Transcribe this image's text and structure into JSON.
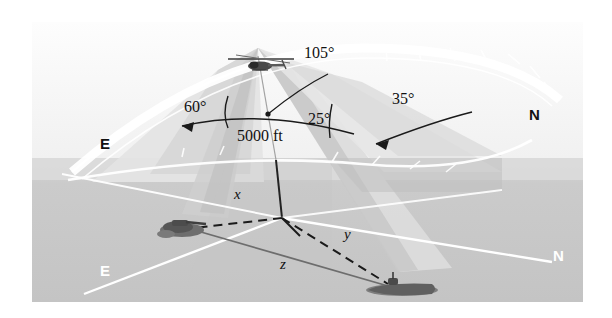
{
  "figure": {
    "altitude_label": "5000 ft",
    "angles": [
      {
        "name": "angle-60",
        "text": "60°"
      },
      {
        "name": "angle-105",
        "text": "105°"
      },
      {
        "name": "angle-25",
        "text": "25°"
      },
      {
        "name": "angle-35",
        "text": "35°"
      }
    ],
    "cardinals": [
      {
        "name": "cardinal-e-upper",
        "text": "E"
      },
      {
        "name": "cardinal-n-upper",
        "text": "N"
      },
      {
        "name": "cardinal-e-lower",
        "text": "E"
      },
      {
        "name": "cardinal-n-lower",
        "text": "N"
      }
    ],
    "axis_vars": [
      {
        "name": "var-x",
        "text": "x"
      },
      {
        "name": "var-y",
        "text": "y"
      },
      {
        "name": "var-z",
        "text": "z"
      }
    ],
    "objects": [
      {
        "name": "helicopter",
        "label": "helicopter"
      },
      {
        "name": "tank",
        "label": "tank"
      },
      {
        "name": "submarine",
        "label": "submarine"
      }
    ],
    "colors": {
      "sky": "#f7f7f7",
      "ground": "#c9c9c9",
      "ground_far": "#d9d9d9",
      "beam_light": "#e2e2e2",
      "beam_mid": "#d2d2d2",
      "beam_dark": "#bcbcbc",
      "white_line": "#ffffff",
      "ink": "#1a1a1a"
    }
  }
}
